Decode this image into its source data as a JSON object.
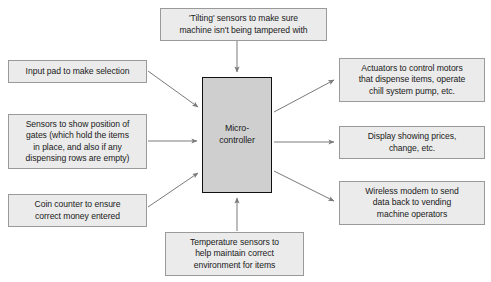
{
  "diagram": {
    "center": {
      "label": "Micro-\ncontroller",
      "fill": "#cfcfcf",
      "border": "#111111"
    },
    "box_fill": "#ebebeb",
    "box_border": "#9a9a9a",
    "arrow_color": "#7a7a7a",
    "nodes": [
      {
        "id": "tilting",
        "label": "'Tilting' sensors to make sure\nmachine isn't being tampered with",
        "role": "input",
        "position": "top"
      },
      {
        "id": "input-pad",
        "label": "Input pad to make selection",
        "role": "input",
        "position": "left-top"
      },
      {
        "id": "gates",
        "label": "Sensors to show position of\ngates (which hold the items\nin place, and also if any\ndispensing rows are empty)",
        "role": "input",
        "position": "left-middle"
      },
      {
        "id": "coin-counter",
        "label": "Coin counter to ensure\ncorrect money entered",
        "role": "input",
        "position": "left-bottom"
      },
      {
        "id": "temperature",
        "label": "Temperature sensors to\nhelp maintain correct\nenvironment for items",
        "role": "input",
        "position": "bottom"
      },
      {
        "id": "actuators",
        "label": "Actuators to control motors\nthat dispense items, operate\nchill system pump, etc.",
        "role": "output",
        "position": "right-top"
      },
      {
        "id": "display",
        "label": "Display showing prices,\nchange, etc.",
        "role": "output",
        "position": "right-middle"
      },
      {
        "id": "wireless",
        "label": "Wireless modem to send\ndata back to vending\nmachine operators",
        "role": "output",
        "position": "right-bottom"
      }
    ]
  }
}
